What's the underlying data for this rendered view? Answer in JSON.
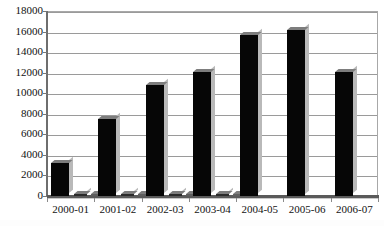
{
  "chart_data": {
    "type": "bar",
    "title": "",
    "xlabel": "",
    "ylabel": "",
    "ylim": [
      0,
      18000
    ],
    "ytick_step": 2000,
    "yticks": [
      "0",
      "2000",
      "4000",
      "6000",
      "8000",
      "10000",
      "12000",
      "14000",
      "16000",
      "18000"
    ],
    "grid": true,
    "legend": "none",
    "categories": [
      "2000-01",
      "2001-02",
      "2002-03",
      "2003-04",
      "2004-05",
      "2005-06",
      "2006-07"
    ],
    "series": [
      {
        "name": "Series 1",
        "color": "#000000",
        "values": [
          3200,
          7500,
          10800,
          12100,
          15700,
          16200,
          12100
        ]
      },
      {
        "name": "Series 2",
        "color": "#2b2b2b",
        "values": [
          180,
          150,
          160,
          170,
          0,
          0,
          0
        ]
      },
      {
        "name": "Series 3",
        "color": "#5e5e5e",
        "values": [
          120,
          130,
          140,
          150,
          0,
          0,
          0
        ]
      }
    ]
  },
  "title_fragment": "",
  "colors": {
    "bar_primary": "#000000",
    "bar_secondary": "#2b2b2b",
    "bar_tertiary": "#5e5e5e",
    "gridline": "#9a9a9a",
    "axis": "#5a5a5a",
    "background": "#ffffff",
    "text": "#111111"
  }
}
